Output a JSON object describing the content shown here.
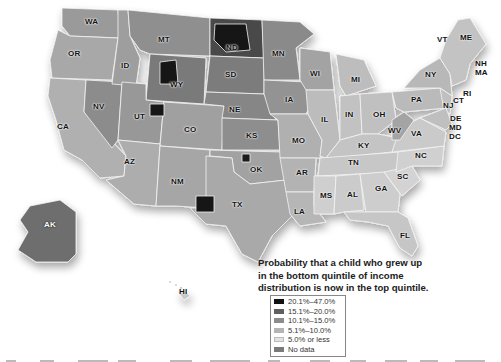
{
  "legend": {
    "title": "Probability that a child who grew up in the bottom quintile of income distribution is now in the top quintile.",
    "title_lines": [
      "Probability that a child who grew up",
      "in the bottom quintile of income",
      "distribution is now in the top quintile."
    ],
    "items": [
      {
        "label": "20.1%–47.0%",
        "color": "#111111"
      },
      {
        "label": "15.1%–20.0%",
        "color": "#606060"
      },
      {
        "label": "10.1%–15.0%",
        "color": "#8c8c8c"
      },
      {
        "label": "5.1%–10.0%",
        "color": "#b4b4b4"
      },
      {
        "label": "5.0% or less",
        "color": "#e2e2e2"
      },
      {
        "label": "No data",
        "color": "#7a7a7a"
      }
    ]
  },
  "state_labels": [
    {
      "abbr": "WA",
      "x": 91,
      "y": 22
    },
    {
      "abbr": "OR",
      "x": 74,
      "y": 54
    },
    {
      "abbr": "CA",
      "x": 63,
      "y": 127
    },
    {
      "abbr": "NV",
      "x": 99,
      "y": 107
    },
    {
      "abbr": "ID",
      "x": 127,
      "y": 66
    },
    {
      "abbr": "MT",
      "x": 164,
      "y": 40
    },
    {
      "abbr": "WY",
      "x": 176,
      "y": 85
    },
    {
      "abbr": "UT",
      "x": 140,
      "y": 117
    },
    {
      "abbr": "AZ",
      "x": 130,
      "y": 162
    },
    {
      "abbr": "CO",
      "x": 190,
      "y": 130
    },
    {
      "abbr": "NM",
      "x": 177,
      "y": 182
    },
    {
      "abbr": "ND",
      "x": 232,
      "y": 48
    },
    {
      "abbr": "SD",
      "x": 231,
      "y": 75
    },
    {
      "abbr": "NE",
      "x": 235,
      "y": 110
    },
    {
      "abbr": "KS",
      "x": 252,
      "y": 136
    },
    {
      "abbr": "OK",
      "x": 256,
      "y": 170
    },
    {
      "abbr": "TX",
      "x": 238,
      "y": 205
    },
    {
      "abbr": "MN",
      "x": 278,
      "y": 54
    },
    {
      "abbr": "IA",
      "x": 291,
      "y": 100
    },
    {
      "abbr": "MO",
      "x": 298,
      "y": 141
    },
    {
      "abbr": "AR",
      "x": 302,
      "y": 173
    },
    {
      "abbr": "LA",
      "x": 300,
      "y": 212
    },
    {
      "abbr": "WI",
      "x": 316,
      "y": 74
    },
    {
      "abbr": "IL",
      "x": 327,
      "y": 120
    },
    {
      "abbr": "MI",
      "x": 357,
      "y": 80
    },
    {
      "abbr": "IN",
      "x": 351,
      "y": 115
    },
    {
      "abbr": "OH",
      "x": 379,
      "y": 115
    },
    {
      "abbr": "KY",
      "x": 364,
      "y": 146
    },
    {
      "abbr": "TN",
      "x": 354,
      "y": 163
    },
    {
      "abbr": "MS",
      "x": 326,
      "y": 196
    },
    {
      "abbr": "AL",
      "x": 353,
      "y": 195
    },
    {
      "abbr": "GA",
      "x": 381,
      "y": 189
    },
    {
      "abbr": "SC",
      "x": 403,
      "y": 177
    },
    {
      "abbr": "NC",
      "x": 421,
      "y": 156
    },
    {
      "abbr": "VA",
      "x": 417,
      "y": 134
    },
    {
      "abbr": "WV",
      "x": 394,
      "y": 131
    },
    {
      "abbr": "PA",
      "x": 417,
      "y": 100
    },
    {
      "abbr": "NY",
      "x": 431,
      "y": 75
    },
    {
      "abbr": "NJ",
      "x": 449,
      "y": 106
    },
    {
      "abbr": "CT",
      "x": 459,
      "y": 101
    },
    {
      "abbr": "RI",
      "x": 469,
      "y": 94
    },
    {
      "abbr": "MA",
      "x": 481,
      "y": 73
    },
    {
      "abbr": "NH",
      "x": 481,
      "y": 64
    },
    {
      "abbr": "VT",
      "x": 443,
      "y": 40
    },
    {
      "abbr": "ME",
      "x": 466,
      "y": 38
    },
    {
      "abbr": "DE",
      "x": 456,
      "y": 119
    },
    {
      "abbr": "MD",
      "x": 455,
      "y": 128
    },
    {
      "abbr": "DC",
      "x": 455,
      "y": 137
    },
    {
      "abbr": "FL",
      "x": 406,
      "y": 236
    },
    {
      "abbr": "AK",
      "x": 50,
      "y": 225
    },
    {
      "abbr": "HI",
      "x": 185,
      "y": 292
    }
  ]
}
